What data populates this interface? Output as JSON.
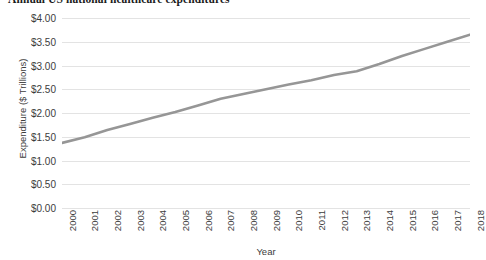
{
  "chart_data": {
    "type": "line",
    "title": "Annual US national healthcare expenditures",
    "xlabel": "Year",
    "ylabel": "Expenditure ($ Trillions)",
    "categories": [
      "2000",
      "2001",
      "2002",
      "2003",
      "2004",
      "2005",
      "2006",
      "2007",
      "2008",
      "2009",
      "2010",
      "2011",
      "2012",
      "2013",
      "2014",
      "2015",
      "2016",
      "2017",
      "2018"
    ],
    "values": [
      1.37,
      1.49,
      1.64,
      1.77,
      1.9,
      2.02,
      2.16,
      2.3,
      2.4,
      2.5,
      2.6,
      2.69,
      2.8,
      2.88,
      3.03,
      3.2,
      3.35,
      3.5,
      3.65
    ],
    "ylim": [
      0,
      4
    ],
    "ytick_labels": [
      "$0.00",
      "$0.50",
      "$1.00",
      "$1.50",
      "$2.00",
      "$2.50",
      "$3.00",
      "$3.50",
      "$4.00"
    ],
    "ytick_values": [
      0,
      0.5,
      1.0,
      1.5,
      2.0,
      2.5,
      3.0,
      3.5,
      4.0
    ],
    "grid": true,
    "legend": false,
    "series_color": "#969696",
    "grid_color": "#e3e3e3",
    "text_color": "#3c3c3c"
  }
}
